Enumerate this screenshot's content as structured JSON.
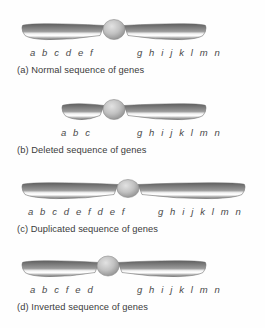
{
  "figure": {
    "background_color": "#fefefe",
    "chromosome_colors": {
      "arm_dark": "#6f6f6f",
      "arm_mid": "#8d8d8d",
      "arm_light": "#ffffff",
      "arm_edge": "#5a5a5a",
      "centromere_fill": "#b9b9b9",
      "centromere_edge": "#8a8a8a"
    },
    "text_colors": {
      "gene_label": "#4a4a4a",
      "caption": "#3b3b3b"
    }
  },
  "panels": [
    {
      "id": "a",
      "caption": "(a) Normal sequence of genes",
      "left_genes": "a b c d e f",
      "right_genes": "g h i j k l m n",
      "left_gene_x": 30,
      "right_gene_x": 137,
      "chromosome": {
        "left_arm_start": 22,
        "left_arm_end": 100,
        "right_arm_start": 128,
        "right_arm_end": 206,
        "centromere_x": 114,
        "centromere_rx": 11,
        "centromere_ry": 10
      }
    },
    {
      "id": "b",
      "caption": "(b) Deleted sequence of genes",
      "left_genes": "a b c",
      "right_genes": "g h i j k l m n",
      "left_gene_x": 61,
      "right_gene_x": 137,
      "chromosome": {
        "left_arm_start": 62,
        "left_arm_end": 100,
        "right_arm_start": 128,
        "right_arm_end": 206,
        "centromere_x": 114,
        "centromere_rx": 11,
        "centromere_ry": 10
      }
    },
    {
      "id": "c",
      "caption": "(c) Duplicated sequence of genes",
      "left_genes": "a b c d e f d e f",
      "right_genes": "g h i j k l m n",
      "left_gene_x": 28,
      "right_gene_x": 158,
      "chromosome": {
        "left_arm_start": 22,
        "left_arm_end": 114,
        "right_arm_start": 142,
        "right_arm_end": 245,
        "centromere_x": 128,
        "centromere_rx": 11,
        "centromere_ry": 9
      }
    },
    {
      "id": "d",
      "caption": "(d) Inverted sequence of genes",
      "left_genes": "a b c f e d",
      "right_genes": "g h i j k l m n",
      "left_gene_x": 30,
      "right_gene_x": 137,
      "chromosome": {
        "left_arm_start": 22,
        "left_arm_end": 95,
        "right_arm_start": 122,
        "right_arm_end": 206,
        "centromere_x": 108,
        "centromere_rx": 11,
        "centromere_ry": 10
      }
    }
  ]
}
